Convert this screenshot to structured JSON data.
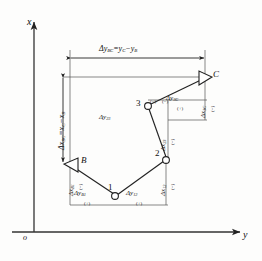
{
  "figure": {
    "type": "surveying-traverse-diagram",
    "axes": {
      "origin_label": "o",
      "x_axis_label": "x",
      "y_axis_label": "y"
    },
    "points": [
      {
        "id": "B",
        "label": "B",
        "marker": "triangle",
        "x": 70,
        "y": 163
      },
      {
        "id": "1",
        "label": "1",
        "marker": "circle",
        "x": 115,
        "y": 196
      },
      {
        "id": "2",
        "label": "2",
        "marker": "circle",
        "x": 166,
        "y": 160
      },
      {
        "id": "3",
        "label": "3",
        "marker": "circle",
        "x": 148,
        "y": 106
      },
      {
        "id": "C",
        "label": "C",
        "marker": "triangle",
        "x": 205,
        "y": 77
      }
    ],
    "overall_dimensions": [
      {
        "name": "delta-y-BC",
        "base": "Δy",
        "sub": "BC",
        "equals": "=",
        "rhs_base1": "y",
        "rhs_sub1": "C",
        "minus": "−",
        "rhs_base2": "y",
        "rhs_sub2": "B",
        "full_text": "Δy BC = y C − y B",
        "orientation": "horizontal"
      },
      {
        "name": "delta-x-BC",
        "base": "Δx",
        "sub": "BC",
        "equals": "=",
        "rhs_base1": "x",
        "rhs_sub1": "C",
        "minus": "−",
        "rhs_base2": "x",
        "rhs_sub2": "B",
        "full_text": "Δx BC = x C − x B",
        "orientation": "vertical"
      }
    ],
    "leg_labels": [
      {
        "name": "delta-x-B1",
        "base": "Δx",
        "sub": "B1",
        "sign": "(−)",
        "orientation": "vertical"
      },
      {
        "name": "delta-y-B1",
        "base": "Δy",
        "sub": "B1",
        "sign": "(+)",
        "orientation": "horizontal"
      },
      {
        "name": "delta-y-12",
        "base": "Δy",
        "sub": "12",
        "sign": "(+)",
        "orientation": "horizontal"
      },
      {
        "name": "delta-x-12",
        "base": "Δx",
        "sub": "12",
        "sign": "(−)",
        "orientation": "vertical"
      },
      {
        "name": "delta-x-23",
        "base": "Δx",
        "sub": "23",
        "sign": "(−)",
        "orientation": "vertical"
      },
      {
        "name": "delta-y-23",
        "base": "Δy",
        "sub": "23",
        "sign": "",
        "orientation": "horizontal"
      },
      {
        "name": "delta-y-3C",
        "base": "Δy",
        "sub": "3C",
        "sign": "(+)",
        "orientation": "horizontal"
      },
      {
        "name": "delta-x-3C",
        "base": "Δx",
        "sub": "3C",
        "sign": "(−)",
        "orientation": "vertical"
      },
      {
        "name": "sign-near-3",
        "base": "",
        "sub": "",
        "sign": "(−)",
        "orientation": "none"
      },
      {
        "name": "sign-near-3C",
        "base": "",
        "sub": "",
        "sign": "(−)",
        "orientation": "none"
      }
    ],
    "colors": {
      "ink": "#1a1a1a",
      "line": "#333333",
      "thin": "#555555",
      "background": "#fdfdfc"
    }
  }
}
